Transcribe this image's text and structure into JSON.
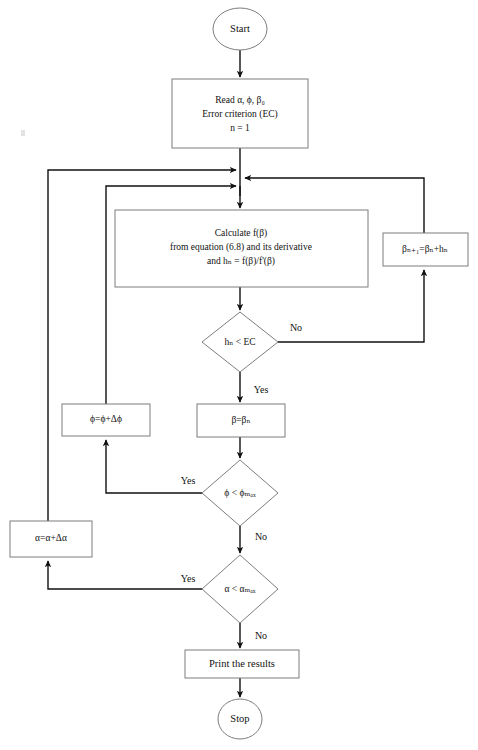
{
  "diagram": {
    "type": "flowchart",
    "nodes": [
      {
        "id": "start",
        "name": "start-terminator",
        "shape": "ellipse",
        "label": "Start",
        "cx": 240,
        "cy": 29,
        "rx": 27,
        "ry": 21
      },
      {
        "id": "read",
        "name": "read-inputs-process",
        "shape": "rect",
        "lines": [
          "Read α, ϕ, β₀",
          "Error criterion (EC)",
          "n = 1"
        ],
        "x": 172,
        "y": 79,
        "w": 136,
        "h": 69
      },
      {
        "id": "calculate",
        "name": "calculate-process",
        "shape": "rect",
        "lines": [
          "Calculate f(β)",
          "from equation (6.8) and its derivative",
          "and hₙ = f(β)/f'(β)"
        ],
        "x": 115,
        "y": 210,
        "w": 253,
        "h": 77
      },
      {
        "id": "beta-update",
        "name": "beta-update-process",
        "shape": "rect",
        "label": "βₙ₊₁=βₙ+hₙ",
        "x": 383,
        "y": 233,
        "w": 85,
        "h": 33
      },
      {
        "id": "hn-check",
        "name": "error-criterion-decision",
        "shape": "diamond",
        "label": "hₙ < EC",
        "cx": 240,
        "cy": 342,
        "rx": 38,
        "ry": 30
      },
      {
        "id": "phi-increment",
        "name": "phi-increment-process",
        "shape": "rect",
        "label": "ϕ=ϕ+Δϕ",
        "x": 62,
        "y": 404,
        "w": 88,
        "h": 32
      },
      {
        "id": "beta-assign",
        "name": "beta-assign-process",
        "shape": "rect",
        "label": "β=βₙ",
        "x": 197,
        "y": 404,
        "w": 88,
        "h": 33
      },
      {
        "id": "phi-check",
        "name": "phi-max-decision",
        "shape": "diamond",
        "label": "ϕ < ϕₘₐₓ",
        "cx": 240,
        "cy": 493,
        "rx": 38,
        "ry": 33
      },
      {
        "id": "alpha-increment",
        "name": "alpha-increment-process",
        "shape": "rect",
        "label": "α=α+Δα",
        "x": 10,
        "y": 521,
        "w": 82,
        "h": 36
      },
      {
        "id": "alpha-check",
        "name": "alpha-max-decision",
        "shape": "diamond",
        "label": "α < αₘₐₓ",
        "cx": 240,
        "cy": 589,
        "rx": 38,
        "ry": 34
      },
      {
        "id": "print",
        "name": "print-results-process",
        "shape": "rect",
        "label": "Print the results",
        "x": 185,
        "y": 650,
        "w": 114,
        "h": 28
      },
      {
        "id": "stop",
        "name": "stop-terminator",
        "shape": "ellipse",
        "label": "Stop",
        "cx": 240,
        "cy": 719,
        "rx": 22,
        "ry": 20
      }
    ],
    "edge_labels": [
      {
        "id": "hn-no",
        "name": "edge-label-hn-no",
        "text": "No",
        "x": 296,
        "y": 329
      },
      {
        "id": "hn-yes",
        "name": "edge-label-hn-yes",
        "text": "Yes",
        "x": 259,
        "y": 391
      },
      {
        "id": "phi-yes",
        "name": "edge-label-phi-yes",
        "text": "Yes",
        "x": 189,
        "y": 482
      },
      {
        "id": "phi-no",
        "name": "edge-label-phi-no",
        "text": "No",
        "x": 259,
        "y": 538
      },
      {
        "id": "alpha-yes",
        "name": "edge-label-alpha-yes",
        "text": "Yes",
        "x": 189,
        "y": 580
      },
      {
        "id": "alpha-no",
        "name": "edge-label-alpha-no",
        "text": "No",
        "x": 259,
        "y": 637
      }
    ],
    "colors": {
      "background": "#ffffff",
      "node_stroke": "#7d7d7d",
      "connector": "#111111",
      "text": "#111111"
    }
  }
}
